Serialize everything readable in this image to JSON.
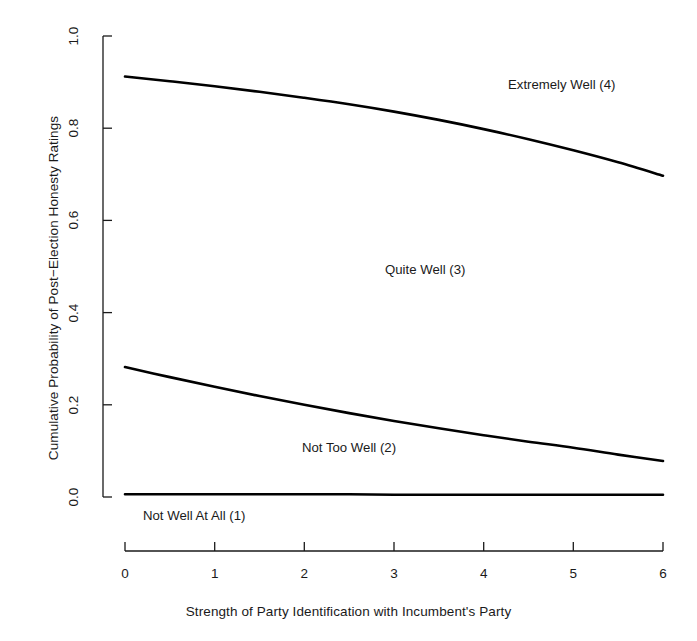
{
  "chart_data": {
    "type": "line",
    "title": "",
    "subtitle": "",
    "xlabel": "Strength of Party Identification with Incumbent's Party",
    "ylabel": "Cumulative Probability of Post−Election Honesty Ratings",
    "xlim": [
      0,
      6
    ],
    "ylim": [
      0,
      1
    ],
    "xticks": [
      "0",
      "1",
      "2",
      "3",
      "4",
      "5",
      "6"
    ],
    "yticks": [
      "0.0",
      "0.2",
      "0.4",
      "0.6",
      "0.8",
      "1.0"
    ],
    "grid": false,
    "legend_position": "none",
    "line_color": "#000000",
    "x": [
      0,
      0.5,
      1,
      1.5,
      2,
      2.5,
      3,
      3.5,
      4,
      4.5,
      5,
      5.5,
      6
    ],
    "series": [
      {
        "name": "Extremely Well (4)",
        "values": [
          0.912,
          0.902,
          0.891,
          0.879,
          0.866,
          0.852,
          0.836,
          0.818,
          0.798,
          0.776,
          0.752,
          0.726,
          0.697
        ]
      },
      {
        "name": "Not Too Well (2)",
        "values": [
          0.282,
          0.26,
          0.239,
          0.219,
          0.2,
          0.182,
          0.165,
          0.149,
          0.134,
          0.12,
          0.107,
          0.092,
          0.078
        ]
      },
      {
        "name": "Not Well At All (1)",
        "values": [
          0.006,
          0.006,
          0.006,
          0.006,
          0.006,
          0.006,
          0.005,
          0.005,
          0.005,
          0.005,
          0.005,
          0.005,
          0.005
        ]
      }
    ],
    "annotations": [
      {
        "text": "Extremely Well (4)",
        "x": 5.05,
        "y": 0.93
      },
      {
        "text": "Quite Well (3)",
        "x": 3.35,
        "y": 0.475
      },
      {
        "text": "Not Too Well (2)",
        "x": 2.15,
        "y": 0.135
      },
      {
        "text": "Not Well At All (1)",
        "x": 0.4,
        "y": 0.042
      }
    ]
  },
  "axes": {
    "x_title": "Strength of Party Identification with Incumbent's Party",
    "y_title": "Cumulative Probability of Post−Election Honesty Ratings",
    "x_ticks": [
      "0",
      "1",
      "2",
      "3",
      "4",
      "5",
      "6"
    ],
    "y_ticks": [
      "0.0",
      "0.2",
      "0.4",
      "0.6",
      "0.8",
      "1.0"
    ]
  },
  "labels": {
    "extremely_well": "Extremely Well (4)",
    "quite_well": "Quite Well (3)",
    "not_too_well": "Not Too Well (2)",
    "not_well_at_all": "Not Well At All (1)"
  },
  "top_cropped_text": ""
}
